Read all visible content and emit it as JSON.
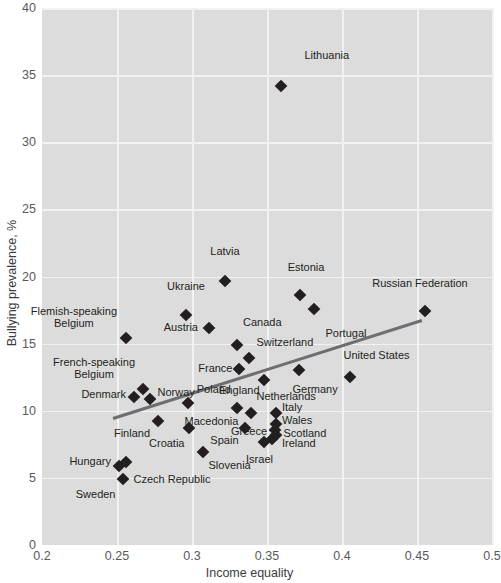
{
  "chart_data": {
    "type": "scatter",
    "title": "",
    "xlabel": "Income equality",
    "ylabel": "Bullying prevalence, %",
    "xlim": [
      0.2,
      0.5
    ],
    "ylim": [
      0,
      40
    ],
    "xticks": [
      "0.2",
      "0.25",
      "0.3",
      "0.35",
      "0.4",
      "0.45",
      "0.5"
    ],
    "xtick_values": [
      0.2,
      0.25,
      0.3,
      0.35,
      0.4,
      0.45,
      0.5
    ],
    "yticks": [
      "0",
      "5",
      "10",
      "15",
      "20",
      "25",
      "30",
      "35",
      "40"
    ],
    "ytick_values": [
      0,
      5,
      10,
      15,
      20,
      25,
      30,
      35,
      40
    ],
    "grid": true,
    "legend": "none",
    "panel_color": "#dcdcdc",
    "grid_color": "#f2f2f2",
    "marker_color": "#231f20",
    "trendline_color": "#6d6e71",
    "trendline": {
      "x0": 0.247,
      "y0": 9.5,
      "x1": 0.453,
      "y1": 16.8
    },
    "points": [
      {
        "label": "Lithuania",
        "x": 0.359,
        "y": 34.2,
        "lx": 0.375,
        "ly": 36.0,
        "anchor": "ne"
      },
      {
        "label": "Latvia",
        "x": 0.322,
        "y": 19.7,
        "lx": 0.322,
        "ly": 21.4,
        "anchor": "n"
      },
      {
        "label": "Estonia",
        "x": 0.372,
        "y": 18.6,
        "lx": 0.376,
        "ly": 20.2,
        "anchor": "n"
      },
      {
        "label": "Portugal",
        "x": 0.381,
        "y": 17.6,
        "lx": 0.389,
        "ly": 16.2,
        "anchor": "se"
      },
      {
        "label": "Russian Federation",
        "x": 0.455,
        "y": 17.4,
        "lx": 0.452,
        "ly": 19.0,
        "anchor": "n"
      },
      {
        "label": "Ukraine",
        "x": 0.296,
        "y": 17.1,
        "lx": 0.296,
        "ly": 18.8,
        "anchor": "n"
      },
      {
        "label": "Austria",
        "x": 0.311,
        "y": 16.2,
        "lx": 0.304,
        "ly": 16.2,
        "anchor": "w"
      },
      {
        "label": "Flemish-speaking\nBelgium",
        "x": 0.256,
        "y": 15.4,
        "lx": 0.25,
        "ly": 16.9,
        "anchor": "w2"
      },
      {
        "label": "Canada",
        "x": 0.33,
        "y": 14.9,
        "lx": 0.334,
        "ly": 16.1,
        "anchor": "ne"
      },
      {
        "label": "Switzerland",
        "x": 0.338,
        "y": 13.9,
        "lx": 0.343,
        "ly": 14.6,
        "anchor": "ne"
      },
      {
        "label": "France",
        "x": 0.331,
        "y": 13.1,
        "lx": 0.327,
        "ly": 13.1,
        "anchor": "w"
      },
      {
        "label": "United States",
        "x": 0.405,
        "y": 12.5,
        "lx": 0.401,
        "ly": 13.6,
        "anchor": "ne"
      },
      {
        "label": "Germany",
        "x": 0.371,
        "y": 13.0,
        "lx": 0.367,
        "ly": 12.0,
        "anchor": "se"
      },
      {
        "label": "England",
        "x": 0.348,
        "y": 12.3,
        "lx": 0.345,
        "ly": 11.9,
        "anchor": "sw"
      },
      {
        "label": "French-speaking\nBelgium",
        "x": 0.267,
        "y": 11.6,
        "lx": 0.262,
        "ly": 13.1,
        "anchor": "w2"
      },
      {
        "label": "Denmark",
        "x": 0.261,
        "y": 11.0,
        "lx": 0.256,
        "ly": 11.2,
        "anchor": "w"
      },
      {
        "label": "Norway",
        "x": 0.272,
        "y": 10.9,
        "lx": 0.277,
        "ly": 11.3,
        "anchor": "e"
      },
      {
        "label": "Macedonia",
        "x": 0.297,
        "y": 10.6,
        "lx": 0.295,
        "ly": 9.6,
        "anchor": "se"
      },
      {
        "label": "Poland",
        "x": 0.33,
        "y": 10.2,
        "lx": 0.326,
        "ly": 11.1,
        "anchor": "nw"
      },
      {
        "label": "Netherlands",
        "x": 0.339,
        "y": 9.8,
        "lx": 0.343,
        "ly": 10.6,
        "anchor": "ne"
      },
      {
        "label": "Finland",
        "x": 0.277,
        "y": 9.2,
        "lx": 0.272,
        "ly": 8.7,
        "anchor": "sw"
      },
      {
        "label": "Croatia",
        "x": 0.298,
        "y": 8.7,
        "lx": 0.295,
        "ly": 8.0,
        "anchor": "sw"
      },
      {
        "label": "Spain",
        "x": 0.335,
        "y": 8.7,
        "lx": 0.331,
        "ly": 8.2,
        "anchor": "sw"
      },
      {
        "label": "Greece",
        "x": 0.355,
        "y": 8.6,
        "lx": 0.35,
        "ly": 8.4,
        "anchor": "w"
      },
      {
        "label": "Italy",
        "x": 0.356,
        "y": 9.8,
        "lx": 0.36,
        "ly": 10.2,
        "anchor": "e"
      },
      {
        "label": "Wales",
        "x": 0.356,
        "y": 9.0,
        "lx": 0.36,
        "ly": 9.2,
        "anchor": "e"
      },
      {
        "label": "Scotland",
        "x": 0.356,
        "y": 8.2,
        "lx": 0.361,
        "ly": 8.3,
        "anchor": "e"
      },
      {
        "label": "Ireland",
        "x": 0.353,
        "y": 7.9,
        "lx": 0.36,
        "ly": 7.5,
        "anchor": "e"
      },
      {
        "label": "Israel",
        "x": 0.348,
        "y": 7.7,
        "lx": 0.345,
        "ly": 6.8,
        "anchor": "s"
      },
      {
        "label": "Slovenia",
        "x": 0.307,
        "y": 6.9,
        "lx": 0.311,
        "ly": 6.3,
        "anchor": "se"
      },
      {
        "label": "Hungary",
        "x": 0.251,
        "y": 5.9,
        "lx": 0.246,
        "ly": 6.2,
        "anchor": "w"
      },
      {
        "label": "Czech Republic",
        "x": 0.256,
        "y": 6.2,
        "lx": 0.261,
        "ly": 5.3,
        "anchor": "se"
      },
      {
        "label": "Sweden",
        "x": 0.254,
        "y": 4.9,
        "lx": 0.249,
        "ly": 4.2,
        "anchor": "sw"
      }
    ]
  }
}
